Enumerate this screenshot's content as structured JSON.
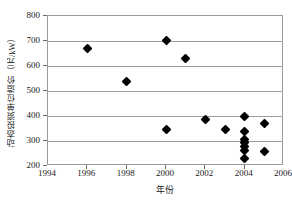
{
  "chart_data": {
    "type": "scatter",
    "title": "",
    "xlabel": "年份",
    "ylabel": "动态投资单位造价（元/kW）",
    "xlim": [
      1994,
      2006
    ],
    "ylim": [
      200,
      800
    ],
    "xticks": [
      1994,
      1996,
      1998,
      2000,
      2002,
      2004,
      2006
    ],
    "yticks": [
      200,
      300,
      400,
      500,
      600,
      700,
      800
    ],
    "grid": true,
    "legend": false,
    "marker": "filled-diamond",
    "marker_color": "#000000",
    "series": [
      {
        "name": "动态投资单位造价",
        "points": [
          {
            "x": 1996.0,
            "y": 670
          },
          {
            "x": 1998.0,
            "y": 537
          },
          {
            "x": 2000.0,
            "y": 702
          },
          {
            "x": 2000.0,
            "y": 345
          },
          {
            "x": 2001.0,
            "y": 629
          },
          {
            "x": 2002.0,
            "y": 388
          },
          {
            "x": 2003.0,
            "y": 348
          },
          {
            "x": 2004.0,
            "y": 397
          },
          {
            "x": 2004.0,
            "y": 338
          },
          {
            "x": 2004.0,
            "y": 305
          },
          {
            "x": 2004.0,
            "y": 295
          },
          {
            "x": 2004.0,
            "y": 278
          },
          {
            "x": 2004.0,
            "y": 262
          },
          {
            "x": 2004.0,
            "y": 230
          },
          {
            "x": 2005.0,
            "y": 372
          },
          {
            "x": 2005.0,
            "y": 257
          }
        ]
      }
    ]
  }
}
